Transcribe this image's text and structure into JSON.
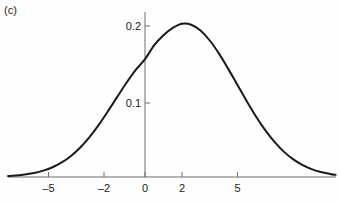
{
  "panel": {
    "label": "(c)"
  },
  "colors": {
    "background": "#fefefe",
    "curve": "#1a1a1a",
    "axis": "#6e6e6e",
    "text": "#1a1a1a"
  },
  "chart_data": {
    "type": "line",
    "title": "",
    "subtitle": "",
    "xlabel": "",
    "ylabel": "",
    "panel_label": "(c)",
    "grid": false,
    "legend": null,
    "xlim": [
      -7.4,
      10.3
    ],
    "ylim": [
      0,
      0.214
    ],
    "xticks": [
      -5,
      -2,
      0,
      2,
      5
    ],
    "xticklabels": [
      "–5",
      "–2",
      "0",
      "2",
      "5"
    ],
    "yticks": [
      0.1,
      0.2
    ],
    "yticklabels": [
      "0.1",
      "0.2"
    ],
    "annotations": [],
    "series": [
      {
        "name": "density",
        "peak_x": 2.0,
        "peak_y": 0.203,
        "value_at_zero": 0.127,
        "x": [
          -7.4,
          -7.0,
          -6.5,
          -6.0,
          -5.5,
          -5.0,
          -4.5,
          -4.0,
          -3.5,
          -3.0,
          -2.5,
          -2.0,
          -1.5,
          -1.0,
          -0.5,
          0.0,
          0.5,
          1.0,
          1.5,
          2.0,
          2.5,
          3.0,
          3.5,
          4.0,
          4.5,
          5.0,
          5.5,
          6.0,
          6.5,
          7.0,
          7.5,
          8.0,
          8.5,
          9.0,
          9.5,
          10.0,
          10.3
        ],
        "y": [
          0.0012,
          0.0019,
          0.0032,
          0.0053,
          0.0084,
          0.0129,
          0.0193,
          0.0279,
          0.0391,
          0.0529,
          0.0691,
          0.0872,
          0.1061,
          0.1248,
          0.1418,
          0.156,
          0.1748,
          0.1878,
          0.1975,
          0.203,
          0.2017,
          0.194,
          0.1808,
          0.1634,
          0.1432,
          0.1218,
          0.1004,
          0.0802,
          0.062,
          0.0464,
          0.0336,
          0.0236,
          0.016,
          0.0105,
          0.0067,
          0.0041,
          0.0029
        ]
      }
    ]
  },
  "axes": {
    "x_axis_name": "x-axis",
    "y_axis_name": "y-axis"
  }
}
